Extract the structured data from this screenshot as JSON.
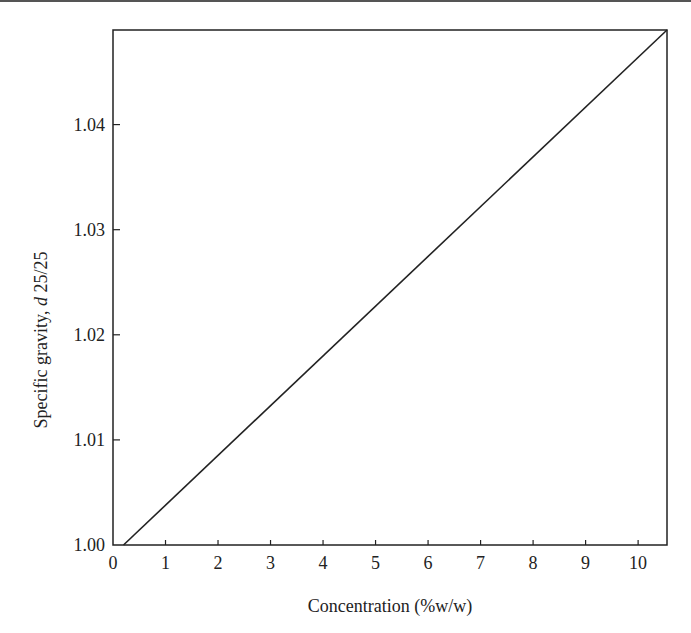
{
  "chart_data": {
    "type": "line",
    "title": "",
    "xlabel": "Concentration (%w/w)",
    "ylabel_prefix": "Specific gravity, ",
    "ylabel_italic": "d",
    "ylabel_suffix": " 25/25",
    "xlim": [
      0,
      10.55
    ],
    "ylim": [
      1.0,
      1.049
    ],
    "grid": false,
    "legend": null,
    "x_ticks": [
      "0",
      "1",
      "2",
      "3",
      "4",
      "5",
      "6",
      "7",
      "8",
      "9",
      "10"
    ],
    "y_ticks": [
      "1.00",
      "1.01",
      "1.02",
      "1.03",
      "1.04"
    ],
    "series": [
      {
        "name": "Specific gravity",
        "x": [
          0.2,
          10.55
        ],
        "y": [
          1.0,
          1.049
        ]
      }
    ]
  }
}
